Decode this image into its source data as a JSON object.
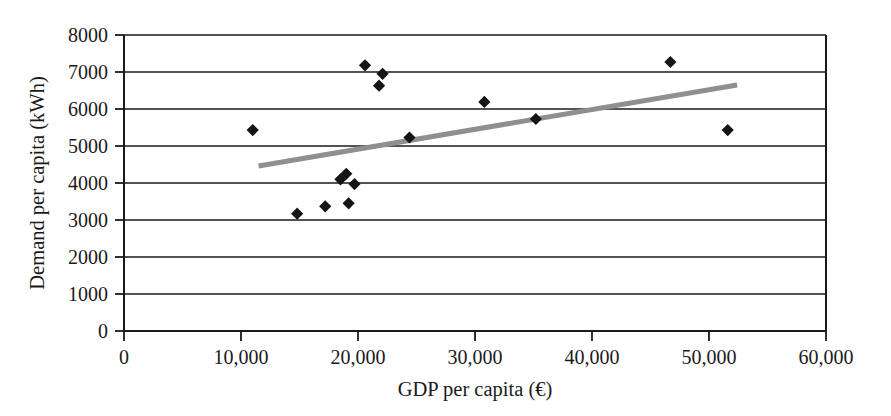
{
  "chart_data": {
    "type": "scatter",
    "title": "",
    "xlabel": "GDP per capita (€)",
    "ylabel": "Demand per capita (kWh)",
    "xlim": [
      0,
      60000
    ],
    "ylim": [
      0,
      8000
    ],
    "grid": "horizontal",
    "legend": "none",
    "x_ticks": [
      0,
      10000,
      20000,
      30000,
      40000,
      50000,
      60000
    ],
    "x_tick_labels": [
      "0",
      "10,000",
      "20,000",
      "30,000",
      "40,000",
      "50,000",
      "60,000"
    ],
    "y_ticks": [
      0,
      1000,
      2000,
      3000,
      4000,
      5000,
      6000,
      7000,
      8000
    ],
    "y_tick_labels": [
      "0",
      "1000",
      "2000",
      "3000",
      "4000",
      "5000",
      "6000",
      "7000",
      "8000"
    ],
    "series": [
      {
        "name": "countries",
        "marker": "diamond",
        "marker_color": "#151515",
        "marker_size": 9,
        "points": [
          {
            "x": 11000,
            "y": 5430
          },
          {
            "x": 14800,
            "y": 3170
          },
          {
            "x": 17200,
            "y": 3370
          },
          {
            "x": 18500,
            "y": 4100
          },
          {
            "x": 19000,
            "y": 4250
          },
          {
            "x": 19200,
            "y": 3450
          },
          {
            "x": 19700,
            "y": 3970
          },
          {
            "x": 20600,
            "y": 7180
          },
          {
            "x": 21800,
            "y": 6630
          },
          {
            "x": 22100,
            "y": 6950
          },
          {
            "x": 24400,
            "y": 5230
          },
          {
            "x": 30800,
            "y": 6190
          },
          {
            "x": 35200,
            "y": 5730
          },
          {
            "x": 46700,
            "y": 7270
          },
          {
            "x": 51600,
            "y": 5430
          }
        ]
      }
    ],
    "trendline": {
      "name": "linear-fit",
      "color": "#8f8f8f",
      "width": 5,
      "x_start": 11500,
      "y_start": 4460,
      "x_end": 52400,
      "y_end": 6650
    },
    "axis_color": "#1a1a1a",
    "grid_color": "#1a1a1a",
    "background": "#ffffff"
  },
  "axes": {
    "x_title": "GDP per capita (€)",
    "y_title": "Demand per capita (kWh)"
  },
  "x_labels": {
    "t0": "0",
    "t1": "10,000",
    "t2": "20,000",
    "t3": "30,000",
    "t4": "40,000",
    "t5": "50,000",
    "t6": "60,000"
  },
  "y_labels": {
    "t0": "0",
    "t1": "1000",
    "t2": "2000",
    "t3": "3000",
    "t4": "4000",
    "t5": "5000",
    "t6": "6000",
    "t7": "7000",
    "t8": "8000"
  }
}
